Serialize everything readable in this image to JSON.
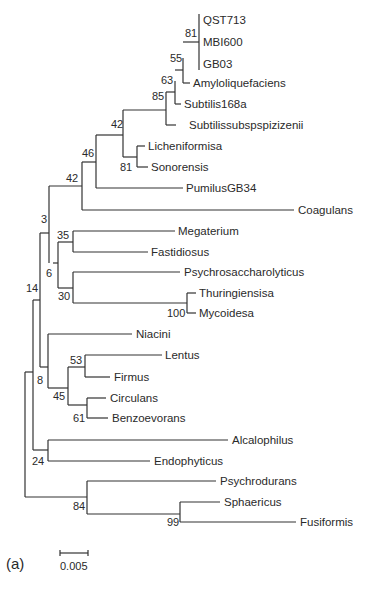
{
  "figure": {
    "panel_label": "(a)",
    "scale_bar": {
      "label": "0.005",
      "x1": 60,
      "x2": 88,
      "y": 553
    }
  },
  "tree": {
    "branches": [
      [
        199,
        14,
        199,
        70
      ],
      [
        183,
        42,
        199,
        42
      ],
      [
        183,
        58,
        183,
        83
      ],
      [
        183,
        83,
        190,
        83
      ],
      [
        175,
        70,
        183,
        70
      ],
      [
        175,
        81,
        175,
        104
      ],
      [
        175,
        104,
        181,
        104
      ],
      [
        166,
        92,
        175,
        92
      ],
      [
        166,
        92,
        166,
        125
      ],
      [
        166,
        125,
        176,
        125
      ],
      [
        123,
        110,
        166,
        110
      ],
      [
        123,
        110,
        123,
        157
      ],
      [
        137,
        146,
        137,
        167
      ],
      [
        137,
        146,
        145,
        146
      ],
      [
        137,
        167,
        148,
        167
      ],
      [
        123,
        157,
        137,
        157
      ],
      [
        96,
        135,
        123,
        135
      ],
      [
        96,
        135,
        96,
        188
      ],
      [
        96,
        188,
        183,
        188
      ],
      [
        82,
        162,
        96,
        162
      ],
      [
        82,
        162,
        82,
        210
      ],
      [
        82,
        210,
        294,
        210
      ],
      [
        49,
        186,
        82,
        186
      ],
      [
        49,
        186,
        49,
        263
      ],
      [
        73,
        231,
        73,
        252
      ],
      [
        73,
        231,
        175,
        231
      ],
      [
        73,
        252,
        148,
        252
      ],
      [
        58,
        242,
        73,
        242
      ],
      [
        58,
        242,
        58,
        288
      ],
      [
        53,
        263,
        58,
        263
      ],
      [
        73,
        272,
        73,
        303
      ],
      [
        73,
        272,
        180,
        272
      ],
      [
        73,
        303,
        187,
        303
      ],
      [
        58,
        288,
        73,
        288
      ],
      [
        187,
        293,
        187,
        313
      ],
      [
        187,
        293,
        196,
        293
      ],
      [
        187,
        313,
        196,
        313
      ],
      [
        40,
        233,
        49,
        233
      ],
      [
        40,
        233,
        40,
        367
      ],
      [
        48,
        334,
        48,
        388
      ],
      [
        48,
        334,
        132,
        334
      ],
      [
        85,
        355,
        85,
        377
      ],
      [
        85,
        355,
        162,
        355
      ],
      [
        85,
        377,
        110,
        377
      ],
      [
        68,
        367,
        85,
        367
      ],
      [
        68,
        367,
        68,
        405
      ],
      [
        87,
        398,
        87,
        418
      ],
      [
        87,
        398,
        106,
        398
      ],
      [
        87,
        418,
        108,
        418
      ],
      [
        68,
        405,
        87,
        405
      ],
      [
        48,
        388,
        68,
        388
      ],
      [
        40,
        367,
        48,
        367
      ],
      [
        33,
        300,
        40,
        300
      ],
      [
        33,
        300,
        33,
        450
      ],
      [
        48,
        440,
        48,
        461
      ],
      [
        48,
        440,
        228,
        440
      ],
      [
        48,
        461,
        150,
        461
      ],
      [
        33,
        450,
        48,
        450
      ],
      [
        25,
        372,
        33,
        372
      ],
      [
        25,
        372,
        25,
        497
      ],
      [
        87,
        481,
        87,
        514
      ],
      [
        87,
        481,
        216,
        481
      ],
      [
        180,
        502,
        180,
        522
      ],
      [
        180,
        502,
        220,
        502
      ],
      [
        180,
        522,
        296,
        522
      ],
      [
        87,
        514,
        180,
        514
      ],
      [
        25,
        497,
        87,
        497
      ]
    ],
    "leaves": [
      {
        "label": "QST713",
        "x": 203,
        "y": 24
      },
      {
        "label": "MBI600",
        "x": 203,
        "y": 46
      },
      {
        "label": "GB03",
        "x": 203,
        "y": 68
      },
      {
        "label": "Amyloliquefaciens",
        "x": 193,
        "y": 87
      },
      {
        "label": "Subtilis168a",
        "x": 184,
        "y": 108
      },
      {
        "label": "Subtilissubspspizizenii",
        "x": 189,
        "y": 129
      },
      {
        "label": "Licheniformisa",
        "x": 148,
        "y": 150
      },
      {
        "label": "Sonorensis",
        "x": 151,
        "y": 171
      },
      {
        "label": "PumilusGB34",
        "x": 186,
        "y": 192
      },
      {
        "label": "Coagulans",
        "x": 298,
        "y": 214
      },
      {
        "label": "Megaterium",
        "x": 178,
        "y": 235
      },
      {
        "label": "Fastidiosus",
        "x": 151,
        "y": 256
      },
      {
        "label": "Psychrosaccharolyticus",
        "x": 184,
        "y": 276
      },
      {
        "label": "Thuringiensisa",
        "x": 199,
        "y": 297
      },
      {
        "label": "Mycoidesa",
        "x": 199,
        "y": 317
      },
      {
        "label": "Niacini",
        "x": 136,
        "y": 338
      },
      {
        "label": "Lentus",
        "x": 165,
        "y": 359
      },
      {
        "label": "Firmus",
        "x": 114,
        "y": 381
      },
      {
        "label": "Circulans",
        "x": 110,
        "y": 402
      },
      {
        "label": "Benzoevorans",
        "x": 112,
        "y": 422
      },
      {
        "label": "Alcalophilus",
        "x": 232,
        "y": 444
      },
      {
        "label": "Endophyticus",
        "x": 154,
        "y": 465
      },
      {
        "label": "Psychrodurans",
        "x": 220,
        "y": 485
      },
      {
        "label": "Sphaericus",
        "x": 224,
        "y": 506
      },
      {
        "label": "Fusiformis",
        "x": 300,
        "y": 526
      }
    ],
    "bootstrap": [
      {
        "value": "81",
        "x": 185,
        "y": 37
      },
      {
        "value": "55",
        "x": 170,
        "y": 62
      },
      {
        "value": "63",
        "x": 161,
        "y": 84
      },
      {
        "value": "85",
        "x": 152,
        "y": 100
      },
      {
        "value": "42",
        "x": 111,
        "y": 128
      },
      {
        "value": "81",
        "x": 120,
        "y": 171
      },
      {
        "value": "46",
        "x": 82,
        "y": 157
      },
      {
        "value": "42",
        "x": 66,
        "y": 182
      },
      {
        "value": "3",
        "x": 41,
        "y": 223
      },
      {
        "value": "35",
        "x": 57,
        "y": 239
      },
      {
        "value": "6",
        "x": 46,
        "y": 277
      },
      {
        "value": "30",
        "x": 58,
        "y": 300
      },
      {
        "value": "100",
        "x": 167,
        "y": 317
      },
      {
        "value": "14",
        "x": 26,
        "y": 292
      },
      {
        "value": "53",
        "x": 70,
        "y": 364
      },
      {
        "value": "8",
        "x": 37,
        "y": 384
      },
      {
        "value": "45",
        "x": 53,
        "y": 400
      },
      {
        "value": "61",
        "x": 73,
        "y": 422
      },
      {
        "value": "24",
        "x": 32,
        "y": 465
      },
      {
        "value": "84",
        "x": 73,
        "y": 510
      },
      {
        "value": "99",
        "x": 167,
        "y": 526
      }
    ]
  }
}
